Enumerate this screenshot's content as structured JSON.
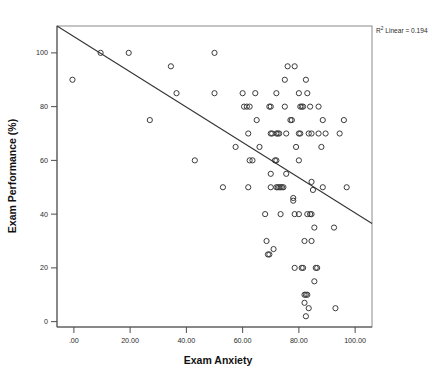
{
  "chart_data": {
    "type": "scatter",
    "title": "",
    "xlabel": "Exam Anxiety",
    "ylabel": "Exam Performance (%)",
    "xlim": [
      -6,
      106
    ],
    "ylim": [
      -2,
      110
    ],
    "xticks": [
      0,
      20,
      40,
      60,
      80,
      100
    ],
    "xticklabels": [
      ".00",
      "20.00",
      "40.00",
      "60.00",
      "80.00",
      "100.00"
    ],
    "yticks": [
      0,
      20,
      40,
      60,
      80,
      100
    ],
    "yticklabels": [
      "0",
      "20",
      "40",
      "60",
      "80",
      "100"
    ],
    "grid": false,
    "legend": null,
    "marker": "open-circle",
    "marker_radius_px": 2.6,
    "annotations": [
      {
        "name": "r2-linear",
        "prefix": "R",
        "superscript": "2",
        "text": " Linear = 0.194",
        "full_text": "R² Linear = 0.194",
        "position": "top-right-outside"
      }
    ],
    "fit_line": {
      "name": "linear-fit",
      "r_squared": 0.194,
      "x_start": -6,
      "y_start": 110,
      "x_end": 106,
      "y_end": 36.5
    },
    "points": [
      [
        -0.5,
        90
      ],
      [
        9.5,
        100
      ],
      [
        19.5,
        100
      ],
      [
        27.0,
        75
      ],
      [
        34.5,
        95
      ],
      [
        36.5,
        85
      ],
      [
        43.0,
        60
      ],
      [
        50.0,
        100
      ],
      [
        50.0,
        85
      ],
      [
        53.0,
        50
      ],
      [
        57.5,
        65
      ],
      [
        60.0,
        85
      ],
      [
        60.5,
        80
      ],
      [
        61.5,
        80
      ],
      [
        62.5,
        80
      ],
      [
        62.0,
        70
      ],
      [
        62.5,
        60
      ],
      [
        63.5,
        60
      ],
      [
        62.0,
        50
      ],
      [
        64.5,
        85
      ],
      [
        65.0,
        75
      ],
      [
        66.0,
        65
      ],
      [
        68.0,
        40
      ],
      [
        68.5,
        30
      ],
      [
        69.0,
        25
      ],
      [
        69.5,
        25
      ],
      [
        69.5,
        80
      ],
      [
        70.0,
        80
      ],
      [
        70.0,
        70
      ],
      [
        70.5,
        70
      ],
      [
        70.0,
        50
      ],
      [
        70.0,
        55
      ],
      [
        71.0,
        27
      ],
      [
        71.5,
        60
      ],
      [
        72.0,
        60
      ],
      [
        72.0,
        85
      ],
      [
        72.0,
        70
      ],
      [
        72.5,
        70
      ],
      [
        73.0,
        70
      ],
      [
        72.0,
        50
      ],
      [
        72.5,
        50
      ],
      [
        73.0,
        50
      ],
      [
        73.5,
        50
      ],
      [
        74.0,
        50
      ],
      [
        74.5,
        50
      ],
      [
        73.5,
        40
      ],
      [
        75.0,
        80
      ],
      [
        75.5,
        70
      ],
      [
        75.5,
        55
      ],
      [
        75.0,
        90
      ],
      [
        76.0,
        95
      ],
      [
        77.0,
        75
      ],
      [
        77.5,
        75
      ],
      [
        78.0,
        45
      ],
      [
        78.0,
        46
      ],
      [
        78.5,
        40
      ],
      [
        78.5,
        95
      ],
      [
        78.5,
        20
      ],
      [
        79.0,
        65
      ],
      [
        80.0,
        85
      ],
      [
        80.5,
        80
      ],
      [
        81.0,
        80
      ],
      [
        81.5,
        80
      ],
      [
        80.0,
        70
      ],
      [
        80.5,
        70
      ],
      [
        80.0,
        40
      ],
      [
        80.0,
        60
      ],
      [
        81.0,
        20
      ],
      [
        81.5,
        20
      ],
      [
        82.0,
        30
      ],
      [
        82.0,
        10
      ],
      [
        82.0,
        7
      ],
      [
        82.5,
        10
      ],
      [
        83.0,
        10
      ],
      [
        82.5,
        2
      ],
      [
        82.5,
        90
      ],
      [
        83.0,
        85
      ],
      [
        83.0,
        40
      ],
      [
        83.5,
        70
      ],
      [
        83.5,
        5
      ],
      [
        84.0,
        80
      ],
      [
        84.5,
        70
      ],
      [
        84.0,
        40
      ],
      [
        84.5,
        40
      ],
      [
        84.5,
        30
      ],
      [
        84.5,
        52
      ],
      [
        85.0,
        49
      ],
      [
        85.5,
        15
      ],
      [
        85.5,
        35
      ],
      [
        86.0,
        20
      ],
      [
        86.5,
        20
      ],
      [
        87.0,
        80
      ],
      [
        87.0,
        70
      ],
      [
        88.0,
        65
      ],
      [
        88.5,
        75
      ],
      [
        88.5,
        50
      ],
      [
        89.5,
        70
      ],
      [
        92.5,
        35
      ],
      [
        93.0,
        5
      ],
      [
        94.5,
        70
      ],
      [
        96.0,
        75
      ],
      [
        97.0,
        50
      ]
    ]
  }
}
